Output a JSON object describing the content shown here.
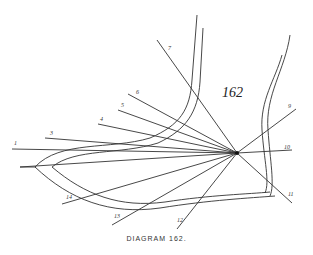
{
  "diagram": {
    "number_label": "162",
    "caption": "DIAGRAM 162.",
    "center": {
      "x": 237,
      "y": 153
    },
    "rays": [
      {
        "label": "1",
        "x": 12,
        "y": 149,
        "lx": 14,
        "ly": 145
      },
      {
        "label": "3",
        "x": 45,
        "y": 138,
        "lx": 50,
        "ly": 135
      },
      {
        "label": "4",
        "x": 98,
        "y": 124,
        "lx": 100,
        "ly": 121
      },
      {
        "label": "5",
        "x": 118,
        "y": 110,
        "lx": 121,
        "ly": 107
      },
      {
        "label": "6",
        "x": 128,
        "y": 94,
        "lx": 136,
        "ly": 94
      },
      {
        "label": "7",
        "x": 157,
        "y": 40,
        "lx": 168,
        "ly": 50
      },
      {
        "label": "9",
        "x": 296,
        "y": 109,
        "lx": 288,
        "ly": 108
      },
      {
        "label": "10",
        "x": 292,
        "y": 150,
        "lx": 284,
        "ly": 149
      },
      {
        "label": "11",
        "x": 292,
        "y": 203,
        "lx": 288,
        "ly": 196
      },
      {
        "label": "12",
        "x": 177,
        "y": 229,
        "lx": 177,
        "ly": 222
      },
      {
        "label": "13",
        "x": 112,
        "y": 225,
        "lx": 114,
        "ly": 218
      },
      {
        "label": "14",
        "x": 62,
        "y": 204,
        "lx": 66,
        "ly": 199
      }
    ]
  }
}
